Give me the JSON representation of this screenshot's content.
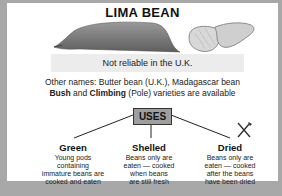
{
  "title": "LIMA BEAN",
  "note": "Not reliable in the U.K.",
  "other_names": "Other names: Butter bean (U.K.), Madagascar bean",
  "varieties": {
    "bush": "Bush",
    "and": " and ",
    "climbing": "Climbing",
    "rest": " (Pole) varieties are available"
  },
  "uses": {
    "label": "USES",
    "items": [
      {
        "heading": "Green",
        "lines": [
          "Young pods",
          "containing",
          "immature beans are",
          "cooked and eaten"
        ]
      },
      {
        "heading": "Shelled",
        "lines": [
          "Beans only are",
          "eaten — cooked",
          "when beans",
          "are still fresh"
        ]
      },
      {
        "heading": "Dried",
        "lines": [
          "Beans only are",
          "eaten — cooked",
          "after the beans",
          "have been dried"
        ]
      }
    ]
  },
  "icons": {
    "pod": "bean-pod-illustration",
    "beans": "lima-beans-illustration",
    "utensils": "knife-fork-icon"
  },
  "colors": {
    "border": "#a8a8a8",
    "note_bg": "#ececec",
    "uses_bg": "#9e9e9e"
  }
}
